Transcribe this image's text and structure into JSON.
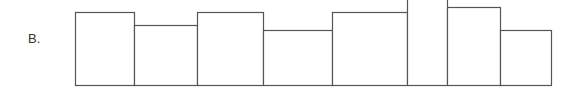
{
  "option_label": "B.",
  "stroke_color": "#555555",
  "baseline_y": 85,
  "bars": [
    {
      "x0": 75,
      "x1": 134,
      "top": 12
    },
    {
      "x0": 134,
      "x1": 197,
      "top": 25
    },
    {
      "x0": 197,
      "x1": 263,
      "top": 12
    },
    {
      "x0": 263,
      "x1": 332,
      "top": 30
    },
    {
      "x0": 332,
      "x1": 407,
      "top": 12
    },
    {
      "x0": 407,
      "x1": 447,
      "top": -2
    },
    {
      "x0": 447,
      "x1": 500,
      "top": 7
    },
    {
      "x0": 500,
      "x1": 551,
      "top": 30
    }
  ]
}
